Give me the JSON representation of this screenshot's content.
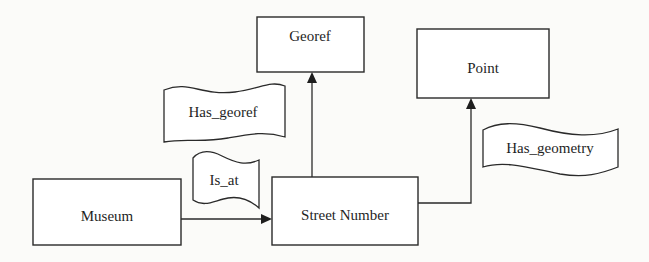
{
  "diagram": {
    "nodes": [
      {
        "id": "georef",
        "label": "Georef"
      },
      {
        "id": "point",
        "label": "Point"
      },
      {
        "id": "museum",
        "label": "Museum"
      },
      {
        "id": "street_number",
        "label": "Street Number"
      }
    ],
    "relations": [
      {
        "id": "is_at",
        "label": "Is_at",
        "from": "Museum",
        "to": "Street Number"
      },
      {
        "id": "has_georef",
        "label": "Has_georef",
        "from": "Street Number",
        "to": "Georef"
      },
      {
        "id": "has_geometry",
        "label": "Has_geometry",
        "from": "Street Number",
        "to": "Point"
      }
    ],
    "colors": {
      "stroke": "#2a2a2a",
      "background": "#fbfbf9"
    }
  }
}
